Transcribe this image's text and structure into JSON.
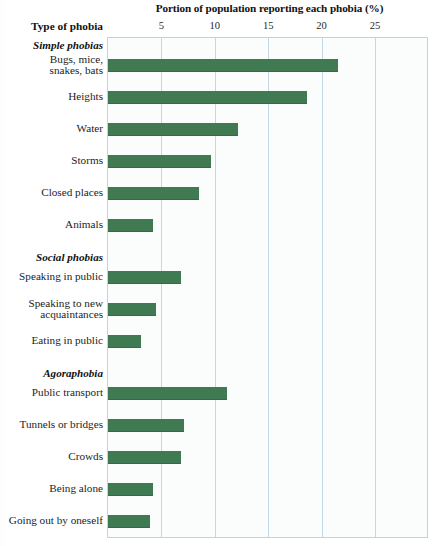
{
  "chart_data": {
    "type": "bar",
    "orientation": "horizontal",
    "title": "Portion of population reporting each phobia (%)",
    "xlabel": "Portion of population reporting each phobia (%)",
    "ylabel": "Type of phobia",
    "xlim": [
      0,
      27
    ],
    "xticks": [
      5,
      10,
      15,
      20,
      25
    ],
    "xtick_labels": [
      "5",
      "10",
      "15",
      "20",
      "25"
    ],
    "grid": true,
    "legend": "none",
    "bar_color": "#3f7a53",
    "grid_color": "#c2d8e7",
    "background_color": "#fbfdfd",
    "groups": [
      {
        "name": "Simple phobias",
        "categories": [
          "Bugs, mice, snakes, bats",
          "Heights",
          "Water",
          "Storms",
          "Closed places",
          "Animals"
        ],
        "values": [
          21.5,
          18.6,
          12.2,
          9.6,
          8.5,
          4.2
        ]
      },
      {
        "name": "Social phobias",
        "categories": [
          "Speaking in public",
          "Speaking to new acquaintances",
          "Eating in public"
        ],
        "values": [
          6.8,
          4.5,
          3.1
        ]
      },
      {
        "name": "Agoraphobia",
        "categories": [
          "Public transport",
          "Tunnels or bridges",
          "Crowds",
          "Being alone",
          "Going out by oneself"
        ],
        "values": [
          11.1,
          7.1,
          6.8,
          4.2,
          3.9
        ]
      }
    ],
    "categories": [
      "Bugs, mice, snakes, bats",
      "Heights",
      "Water",
      "Storms",
      "Closed places",
      "Animals",
      "Speaking in public",
      "Speaking to new acquaintances",
      "Eating in public",
      "Public transport",
      "Tunnels or bridges",
      "Crowds",
      "Being alone",
      "Going out by oneself"
    ],
    "values": [
      21.5,
      18.6,
      12.2,
      9.6,
      8.5,
      4.2,
      6.8,
      4.5,
      3.1,
      11.1,
      7.1,
      6.8,
      4.2,
      3.9
    ]
  },
  "header": {
    "title": "Portion of population reporting each phobia (%)",
    "axis_header": "Type of phobia"
  },
  "ticks": [
    {
      "label": "5",
      "value": 5
    },
    {
      "label": "10",
      "value": 10
    },
    {
      "label": "15",
      "value": 15
    },
    {
      "label": "20",
      "value": 20
    },
    {
      "label": "25",
      "value": 25
    }
  ],
  "sections": [
    {
      "name": "Simple phobias"
    },
    {
      "name": "Social phobias"
    },
    {
      "name": "Agoraphobia"
    }
  ],
  "rows": [
    {
      "type": "section",
      "label": "Simple phobias"
    },
    {
      "type": "bar",
      "label": "Bugs, mice,\nsnakes, bats",
      "label_line1": "Bugs, mice,",
      "label_line2": "snakes, bats",
      "value": 21.5
    },
    {
      "type": "bar",
      "label": "Heights",
      "value": 18.6
    },
    {
      "type": "bar",
      "label": "Water",
      "value": 12.2
    },
    {
      "type": "bar",
      "label": "Storms",
      "value": 9.6
    },
    {
      "type": "bar",
      "label": "Closed places",
      "value": 8.5
    },
    {
      "type": "bar",
      "label": "Animals",
      "value": 4.2
    },
    {
      "type": "section",
      "label": "Social phobias"
    },
    {
      "type": "bar",
      "label": "Speaking in public",
      "value": 6.8
    },
    {
      "type": "bar",
      "label": "Speaking to new\nacquaintances",
      "label_line1": "Speaking to new",
      "label_line2": "acquaintances",
      "value": 4.5
    },
    {
      "type": "bar",
      "label": "Eating in public",
      "value": 3.1
    },
    {
      "type": "section",
      "label": "Agoraphobia"
    },
    {
      "type": "bar",
      "label": "Public transport",
      "value": 11.1
    },
    {
      "type": "bar",
      "label": "Tunnels or bridges",
      "value": 7.1
    },
    {
      "type": "bar",
      "label": "Crowds",
      "value": 6.8
    },
    {
      "type": "bar",
      "label": "Being alone",
      "value": 4.2
    },
    {
      "type": "bar",
      "label": "Going out by oneself",
      "value": 3.9
    }
  ]
}
